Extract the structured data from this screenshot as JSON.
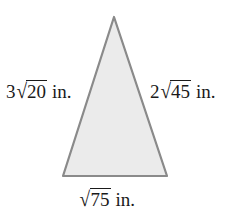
{
  "figure": {
    "shape_name": "triangle",
    "fill_color": "#ebebeb",
    "stroke_color": "#8a8a8a",
    "background_color": "#ffffff",
    "vertices": {
      "apex": {
        "x": 114,
        "y": 17
      },
      "bottom_left": {
        "x": 63,
        "y": 176
      },
      "bottom_right": {
        "x": 167,
        "y": 176
      }
    }
  },
  "labels": {
    "left_side": {
      "full_text": "3√20 in.",
      "coefficient": "3",
      "radical_sign": "√",
      "radicand": "20",
      "unit": "in."
    },
    "right_side": {
      "full_text": "2√45 in.",
      "coefficient": "2",
      "radical_sign": "√",
      "radicand": "45",
      "unit": "in."
    },
    "bottom_side": {
      "full_text": "√75 in.",
      "coefficient": "",
      "radical_sign": "√",
      "radicand": "75",
      "unit": "in."
    }
  }
}
